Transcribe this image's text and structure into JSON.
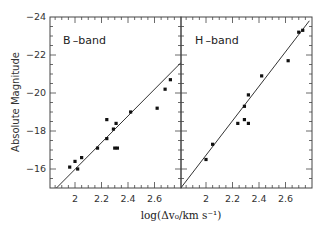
{
  "chart_data": [
    {
      "type": "scatter",
      "title": "B-band",
      "panel_label": "B –band",
      "xlabel": "log(Δv₀/km s⁻¹)",
      "ylabel": "Absolute Magnitude",
      "xlim": [
        1.81,
        2.8
      ],
      "ylim": [
        -15,
        -24
      ],
      "xticks": [
        2,
        2.2,
        2.4,
        2.6
      ],
      "xtick_labels": [
        "2",
        "2.2",
        "2.4",
        "2.6"
      ],
      "yticks": [
        -24,
        -22,
        -20,
        -18,
        -16
      ],
      "ytick_labels": [
        "-24",
        "-22",
        "-20",
        "-18",
        "-16"
      ],
      "grid": false,
      "points": [
        {
          "x": 1.96,
          "y": -16.1
        },
        {
          "x": 2.0,
          "y": -16.4
        },
        {
          "x": 2.02,
          "y": -16.0
        },
        {
          "x": 2.05,
          "y": -16.6
        },
        {
          "x": 2.17,
          "y": -17.1
        },
        {
          "x": 2.24,
          "y": -18.6
        },
        {
          "x": 2.24,
          "y": -17.6
        },
        {
          "x": 2.29,
          "y": -18.1
        },
        {
          "x": 2.3,
          "y": -17.1
        },
        {
          "x": 2.31,
          "y": -18.4
        },
        {
          "x": 2.32,
          "y": -17.1
        },
        {
          "x": 2.42,
          "y": -19.0
        },
        {
          "x": 2.62,
          "y": -19.2
        },
        {
          "x": 2.68,
          "y": -20.2
        },
        {
          "x": 2.72,
          "y": -20.7
        }
      ],
      "fit_line": {
        "x": [
          1.86,
          2.8
        ],
        "y": [
          -15.0,
          -21.6
        ]
      }
    },
    {
      "type": "scatter",
      "title": "H-band",
      "panel_label": "H –band",
      "xlabel": "log(Δv₀/km s⁻¹)",
      "ylabel": "Absolute Magnitude",
      "xlim": [
        1.81,
        2.8
      ],
      "ylim": [
        -15,
        -24
      ],
      "xticks": [
        2,
        2.2,
        2.4,
        2.6
      ],
      "xtick_labels": [
        "2",
        "2.2",
        "2.4",
        "2.6"
      ],
      "grid": false,
      "points": [
        {
          "x": 2.0,
          "y": -16.5
        },
        {
          "x": 2.05,
          "y": -17.3
        },
        {
          "x": 2.24,
          "y": -18.4
        },
        {
          "x": 2.29,
          "y": -18.6
        },
        {
          "x": 2.29,
          "y": -19.3
        },
        {
          "x": 2.32,
          "y": -18.4
        },
        {
          "x": 2.32,
          "y": -19.9
        },
        {
          "x": 2.42,
          "y": -20.9
        },
        {
          "x": 2.62,
          "y": -21.7
        },
        {
          "x": 2.7,
          "y": -23.2
        },
        {
          "x": 2.73,
          "y": -23.3
        }
      ],
      "fit_line": {
        "x": [
          1.81,
          2.78
        ],
        "y": [
          -15.0,
          -23.8
        ]
      }
    }
  ],
  "labels": {
    "ylabel": "Absolute Magnitude",
    "xlabel": "log(Δv₀/km s⁻¹)",
    "panel_b": "B –band",
    "panel_h": "H –band"
  }
}
